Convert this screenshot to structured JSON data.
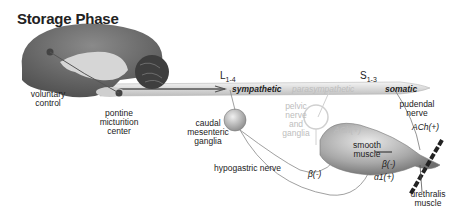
{
  "title": "Storage Phase",
  "spinal_segments": {
    "lumbar": {
      "letter": "L",
      "sub": "1-4"
    },
    "sacral": {
      "letter": "S",
      "sub": "1-3"
    }
  },
  "cord_labels": {
    "sympathetic": "sympathetic",
    "parasympathetic": "parasympathetic",
    "somatic": "somatic"
  },
  "brain_labels": {
    "voluntary_control": [
      "voluntary",
      "control"
    ],
    "pontine_center": [
      "pontine",
      "micturition",
      "center"
    ]
  },
  "ganglia_labels": {
    "caudal_mesenteric": [
      "caudal",
      "mesenteric",
      "ganglia"
    ],
    "pelvic": [
      "pelvic nerve",
      "and ganglia"
    ]
  },
  "nerve_labels": {
    "hypogastric": "hypogastric nerve",
    "pudendal": [
      "pudendal",
      "nerve"
    ]
  },
  "receptor_labels": {
    "ach_pelvic": "ACh(+)",
    "ach_pudendal": "ACh(+)",
    "beta_body": "β(-)",
    "beta_neck": "β(-)",
    "alpha_neck": "α1(+)"
  },
  "muscle_labels": {
    "smooth": [
      "smooth",
      "muscle"
    ],
    "urethralis": [
      "urethralis",
      "muscle"
    ]
  },
  "colors": {
    "brain": "#6e6e6e",
    "cord": "#e2e2e2",
    "bladder": "#9a9a9a",
    "faded_text": "#bdbdbd",
    "text": "#222222"
  }
}
